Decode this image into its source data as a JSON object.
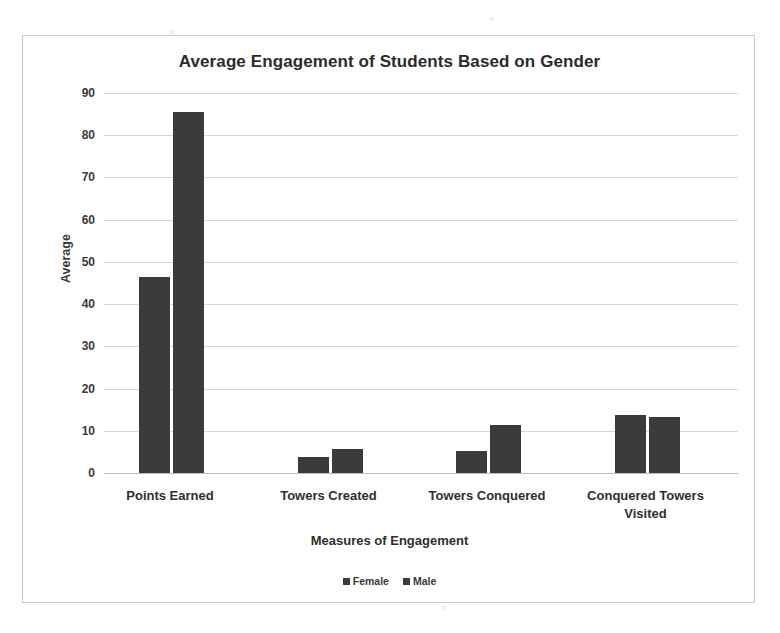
{
  "chart_data": {
    "type": "bar",
    "title": "Average Engagement of Students Based on Gender",
    "xlabel": "Measures of Engagement",
    "ylabel": "Average",
    "categories": [
      "Points Earned",
      "Towers Created",
      "Towers Conquered",
      "Conquered Towers Visited"
    ],
    "series": [
      {
        "name": "Female",
        "color": "#3b3b3b",
        "values": [
          46.5,
          3.8,
          5.3,
          13.8
        ]
      },
      {
        "name": "Male",
        "color": "#3b3b3b",
        "values": [
          85.5,
          5.7,
          11.4,
          13.3
        ]
      }
    ],
    "ylim": [
      0,
      90
    ],
    "yticks": [
      90,
      80,
      70,
      60,
      50,
      40,
      30,
      20,
      10,
      0
    ],
    "ytick_labels": [
      "90",
      "80",
      "70",
      "60",
      "50",
      "40",
      "30",
      "20",
      "10",
      "0"
    ],
    "grid": true,
    "legend_position": "bottom",
    "legend_entries": [
      "Female",
      "Male"
    ]
  },
  "legend": {
    "items": [
      {
        "label": "Female"
      },
      {
        "label": "Male"
      }
    ]
  }
}
